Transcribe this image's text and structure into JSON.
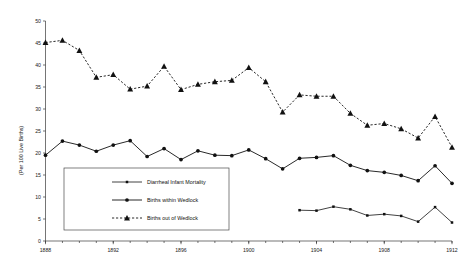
{
  "chart_data": {
    "type": "line",
    "title": "",
    "xlabel": "",
    "ylabel": "(Per 100 Live Births)",
    "xlim": [
      1888,
      1912
    ],
    "ylim": [
      0,
      50
    ],
    "ytick_step": 5,
    "yticks": [
      "0",
      "5",
      "10",
      "15",
      "20",
      "25",
      "30",
      "35",
      "40",
      "45",
      "50"
    ],
    "xticks": [
      "1888",
      "1892",
      "1896",
      "1900",
      "1904",
      "1908",
      "1912"
    ],
    "x": [
      1888,
      1889,
      1890,
      1891,
      1892,
      1893,
      1894,
      1895,
      1896,
      1897,
      1898,
      1899,
      1900,
      1901,
      1902,
      1903,
      1904,
      1905,
      1906,
      1907,
      1908,
      1909,
      1910,
      1911,
      1912
    ],
    "grid": false,
    "legend_position": "lower-left-inside",
    "series": [
      {
        "name": "Diarrheal Infant Mortality",
        "marker": "small-square",
        "linestyle": "solid",
        "x": [
          1903,
          1904,
          1905,
          1906,
          1907,
          1908,
          1909,
          1910,
          1911,
          1912
        ],
        "values": [
          7.0,
          6.9,
          7.8,
          7.2,
          5.8,
          6.1,
          5.7,
          4.4,
          7.7,
          4.2
        ]
      },
      {
        "name": "Births within Wedlock",
        "marker": "circle",
        "linestyle": "solid",
        "x": [
          1888,
          1889,
          1890,
          1891,
          1892,
          1893,
          1894,
          1895,
          1896,
          1897,
          1898,
          1899,
          1900,
          1901,
          1902,
          1903,
          1904,
          1905,
          1906,
          1907,
          1908,
          1909,
          1910,
          1911,
          1912
        ],
        "values": [
          19.5,
          22.7,
          21.8,
          20.4,
          21.8,
          22.8,
          19.2,
          21.0,
          18.5,
          20.5,
          19.5,
          19.4,
          20.7,
          18.7,
          16.4,
          18.8,
          19.0,
          19.4,
          17.2,
          16.0,
          15.6,
          14.9,
          13.7,
          17.1,
          13.1
        ]
      },
      {
        "name": "Births out of Wedlock",
        "marker": "triangle",
        "linestyle": "dashed",
        "x": [
          1888,
          1889,
          1890,
          1891,
          1892,
          1893,
          1894,
          1895,
          1896,
          1897,
          1898,
          1899,
          1900,
          1901,
          1902,
          1903,
          1904,
          1905,
          1906,
          1907,
          1908,
          1909,
          1910,
          1911,
          1912
        ],
        "values": [
          45.1,
          45.6,
          43.3,
          37.2,
          37.8,
          34.5,
          35.2,
          39.7,
          34.4,
          35.6,
          36.2,
          36.5,
          39.4,
          36.2,
          29.3,
          33.2,
          32.9,
          32.9,
          29.0,
          26.3,
          26.7,
          25.5,
          23.4,
          28.3,
          21.3
        ]
      }
    ],
    "legend": [
      {
        "label": "Diarrheal Infant Mortality",
        "marker": "small-square",
        "linestyle": "solid"
      },
      {
        "label": "Births within Wedlock",
        "marker": "circle",
        "linestyle": "solid"
      },
      {
        "label": "Births out of Wedlock",
        "marker": "triangle",
        "linestyle": "dashed"
      }
    ]
  }
}
